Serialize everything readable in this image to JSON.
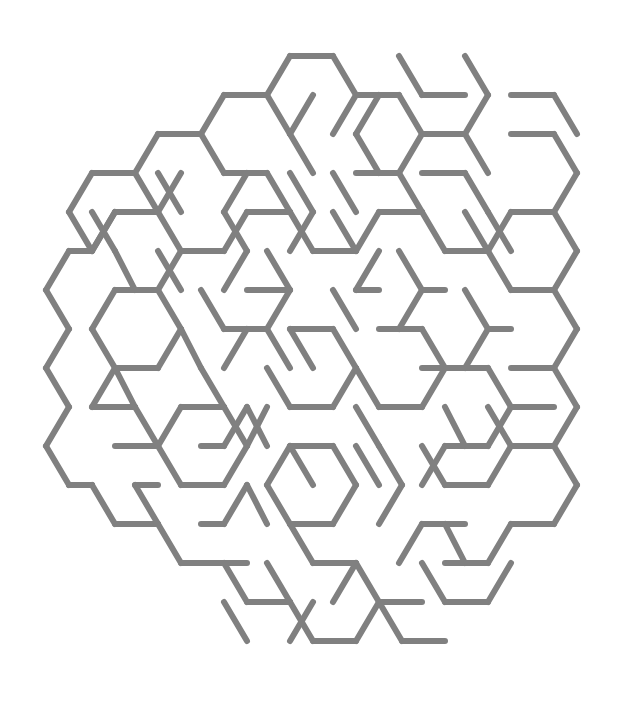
{
  "document": {
    "title": "Hexagonal Maze",
    "kind": "puzzle-maze",
    "description": "A hexagonal-cell maze rendered as gray line segments on a white background."
  },
  "canvas": {
    "width": 618,
    "height": 713,
    "background_color": "#ffffff"
  },
  "style": {
    "wall_color": "#808080",
    "wall_width": 6,
    "line_cap": "round",
    "line_join": "round"
  },
  "geometry": {
    "hex_orientation": "flat-top",
    "side_length": 23.0,
    "column_pitch_x": 34.5,
    "row_pitch_y": 39.8,
    "origin_x": 295,
    "origin_y": 76,
    "columns": 15,
    "rows": 17
  },
  "maze": {
    "cell_count": 169,
    "bounding_box": {
      "left": 40,
      "top": 45,
      "right": 580,
      "bottom": 668
    },
    "wall_segment_count": 232,
    "walls": [
      [
        290,
        56,
        333,
        56
      ],
      [
        333,
        56,
        356,
        95
      ],
      [
        290,
        56,
        267,
        95
      ],
      [
        267,
        95,
        290,
        134
      ],
      [
        356,
        95,
        399,
        95
      ],
      [
        399,
        95,
        422,
        134
      ],
      [
        356,
        95,
        333,
        134
      ],
      [
        422,
        134,
        465,
        134
      ],
      [
        465,
        134,
        488,
        95
      ],
      [
        488,
        95,
        465,
        56
      ],
      [
        465,
        134,
        488,
        173
      ],
      [
        422,
        134,
        399,
        173
      ],
      [
        224,
        95,
        267,
        95
      ],
      [
        224,
        95,
        201,
        134
      ],
      [
        201,
        134,
        224,
        173
      ],
      [
        158,
        134,
        201,
        134
      ],
      [
        158,
        134,
        135,
        173
      ],
      [
        135,
        173,
        158,
        212
      ],
      [
        92,
        173,
        135,
        173
      ],
      [
        92,
        173,
        69,
        212
      ],
      [
        69,
        212,
        92,
        251
      ],
      [
        69,
        251,
        46,
        290
      ],
      [
        46,
        290,
        69,
        329
      ],
      [
        69,
        329,
        46,
        368
      ],
      [
        46,
        368,
        69,
        407
      ],
      [
        69,
        407,
        46,
        446
      ],
      [
        46,
        446,
        69,
        485
      ],
      [
        69,
        485,
        92,
        485
      ],
      [
        92,
        485,
        115,
        524
      ],
      [
        115,
        524,
        158,
        524
      ],
      [
        158,
        524,
        181,
        563
      ],
      [
        181,
        563,
        224,
        563
      ],
      [
        224,
        563,
        247,
        602
      ],
      [
        247,
        602,
        290,
        602
      ],
      [
        290,
        602,
        313,
        641
      ],
      [
        313,
        641,
        356,
        641
      ],
      [
        356,
        641,
        379,
        602
      ],
      [
        379,
        602,
        422,
        602
      ],
      [
        92,
        251,
        69,
        251
      ],
      [
        92,
        251,
        115,
        212
      ],
      [
        115,
        212,
        158,
        212
      ],
      [
        158,
        212,
        181,
        251
      ],
      [
        181,
        251,
        224,
        251
      ],
      [
        224,
        251,
        247,
        212
      ],
      [
        247,
        212,
        290,
        212
      ],
      [
        290,
        212,
        313,
        251
      ],
      [
        313,
        251,
        356,
        251
      ],
      [
        356,
        251,
        379,
        212
      ],
      [
        379,
        212,
        422,
        212
      ],
      [
        422,
        212,
        445,
        251
      ],
      [
        445,
        251,
        488,
        251
      ],
      [
        488,
        251,
        511,
        212
      ],
      [
        511,
        212,
        554,
        212
      ],
      [
        554,
        212,
        577,
        251
      ],
      [
        577,
        251,
        554,
        290
      ],
      [
        554,
        290,
        577,
        329
      ],
      [
        577,
        329,
        554,
        368
      ],
      [
        554,
        368,
        577,
        407
      ],
      [
        577,
        407,
        554,
        446
      ],
      [
        554,
        446,
        577,
        485
      ],
      [
        577,
        485,
        554,
        524
      ],
      [
        554,
        524,
        511,
        524
      ],
      [
        511,
        524,
        488,
        563
      ],
      [
        488,
        563,
        445,
        563
      ],
      [
        115,
        290,
        158,
        290
      ],
      [
        158,
        290,
        181,
        329
      ],
      [
        181,
        329,
        158,
        368
      ],
      [
        158,
        368,
        115,
        368
      ],
      [
        115,
        368,
        92,
        329
      ],
      [
        92,
        329,
        115,
        290
      ],
      [
        201,
        290,
        224,
        329
      ],
      [
        224,
        329,
        267,
        329
      ],
      [
        267,
        329,
        290,
        290
      ],
      [
        290,
        290,
        267,
        251
      ],
      [
        247,
        290,
        290,
        290
      ],
      [
        267,
        368,
        290,
        407
      ],
      [
        290,
        407,
        333,
        407
      ],
      [
        333,
        407,
        356,
        368
      ],
      [
        356,
        368,
        333,
        329
      ],
      [
        333,
        329,
        290,
        329
      ],
      [
        181,
        407,
        224,
        407
      ],
      [
        224,
        407,
        247,
        446
      ],
      [
        247,
        446,
        224,
        485
      ],
      [
        224,
        485,
        181,
        485
      ],
      [
        181,
        485,
        158,
        446
      ],
      [
        158,
        446,
        181,
        407
      ],
      [
        115,
        446,
        158,
        446
      ],
      [
        135,
        485,
        158,
        524
      ],
      [
        201,
        524,
        224,
        524
      ],
      [
        224,
        524,
        247,
        485
      ],
      [
        290,
        446,
        333,
        446
      ],
      [
        333,
        446,
        356,
        485
      ],
      [
        356,
        485,
        333,
        524
      ],
      [
        333,
        524,
        290,
        524
      ],
      [
        290,
        524,
        267,
        485
      ],
      [
        267,
        485,
        290,
        446
      ],
      [
        379,
        329,
        422,
        329
      ],
      [
        422,
        329,
        445,
        368
      ],
      [
        445,
        368,
        422,
        407
      ],
      [
        422,
        407,
        379,
        407
      ],
      [
        379,
        407,
        356,
        368
      ],
      [
        399,
        251,
        422,
        290
      ],
      [
        422,
        290,
        399,
        329
      ],
      [
        465,
        290,
        488,
        329
      ],
      [
        488,
        329,
        465,
        368
      ],
      [
        465,
        368,
        422,
        368
      ],
      [
        445,
        446,
        488,
        446
      ],
      [
        488,
        446,
        511,
        407
      ],
      [
        511,
        407,
        488,
        368
      ],
      [
        488,
        368,
        445,
        368
      ],
      [
        511,
        290,
        554,
        290
      ],
      [
        511,
        290,
        488,
        251
      ],
      [
        445,
        485,
        488,
        485
      ],
      [
        488,
        485,
        511,
        446
      ],
      [
        333,
        173,
        356,
        212
      ],
      [
        356,
        173,
        399,
        173
      ],
      [
        267,
        173,
        290,
        212
      ],
      [
        224,
        173,
        267,
        173
      ],
      [
        181,
        173,
        158,
        212
      ],
      [
        356,
        134,
        379,
        173
      ],
      [
        422,
        173,
        465,
        173
      ],
      [
        465,
        173,
        488,
        212
      ],
      [
        92,
        407,
        135,
        407
      ],
      [
        135,
        407,
        158,
        446
      ],
      [
        115,
        368,
        92,
        407
      ],
      [
        247,
        173,
        224,
        212
      ],
      [
        290,
        134,
        313,
        173
      ],
      [
        379,
        446,
        402,
        485
      ],
      [
        402,
        485,
        379,
        524
      ],
      [
        356,
        563,
        379,
        602
      ],
      [
        313,
        563,
        356,
        563
      ],
      [
        313,
        563,
        290,
        524
      ],
      [
        267,
        563,
        290,
        602
      ],
      [
        247,
        563,
        224,
        563
      ],
      [
        399,
        563,
        422,
        524
      ],
      [
        422,
        524,
        465,
        524
      ],
      [
        445,
        602,
        488,
        602
      ],
      [
        488,
        602,
        511,
        563
      ],
      [
        201,
        446,
        224,
        446
      ],
      [
        92,
        485,
        69,
        485
      ],
      [
        158,
        251,
        181,
        290
      ],
      [
        224,
        212,
        247,
        251
      ],
      [
        313,
        95,
        290,
        134
      ],
      [
        379,
        95,
        356,
        134
      ],
      [
        511,
        134,
        554,
        134
      ],
      [
        554,
        134,
        577,
        173
      ],
      [
        577,
        173,
        554,
        212
      ],
      [
        511,
        95,
        554,
        95
      ],
      [
        554,
        95,
        577,
        134
      ],
      [
        488,
        407,
        511,
        446
      ],
      [
        422,
        446,
        445,
        485
      ],
      [
        333,
        602,
        356,
        563
      ],
      [
        290,
        641,
        313,
        602
      ],
      [
        135,
        290,
        115,
        251
      ],
      [
        201,
        368,
        224,
        407
      ],
      [
        267,
        446,
        247,
        407
      ],
      [
        313,
        368,
        290,
        329
      ],
      [
        356,
        290,
        379,
        290
      ],
      [
        247,
        329,
        224,
        368
      ],
      [
        465,
        212,
        488,
        251
      ],
      [
        399,
        173,
        422,
        212
      ],
      [
        92,
        212,
        115,
        251
      ],
      [
        158,
        173,
        181,
        212
      ],
      [
        313,
        485,
        290,
        446
      ],
      [
        379,
        485,
        356,
        446
      ],
      [
        511,
        368,
        554,
        368
      ],
      [
        465,
        446,
        445,
        407
      ],
      [
        224,
        602,
        247,
        641
      ],
      [
        402,
        641,
        445,
        641
      ],
      [
        402,
        641,
        379,
        602
      ],
      [
        135,
        407,
        115,
        368
      ],
      [
        181,
        329,
        201,
        368
      ],
      [
        290,
        368,
        267,
        329
      ],
      [
        247,
        251,
        224,
        290
      ],
      [
        356,
        407,
        379,
        446
      ],
      [
        422,
        485,
        445,
        446
      ],
      [
        511,
        251,
        488,
        212
      ],
      [
        554,
        446,
        511,
        446
      ],
      [
        290,
        173,
        313,
        212
      ],
      [
        333,
        212,
        356,
        251
      ],
      [
        181,
        251,
        158,
        290
      ],
      [
        115,
        212,
        92,
        251
      ],
      [
        465,
        95,
        422,
        95
      ],
      [
        399,
        56,
        422,
        95
      ],
      [
        333,
        290,
        356,
        329
      ],
      [
        267,
        407,
        247,
        446
      ],
      [
        511,
        329,
        488,
        329
      ],
      [
        554,
        407,
        511,
        407
      ],
      [
        224,
        446,
        247,
        407
      ],
      [
        158,
        485,
        135,
        485
      ],
      [
        379,
        251,
        356,
        290
      ],
      [
        445,
        290,
        422,
        290
      ],
      [
        290,
        251,
        313,
        212
      ],
      [
        247,
        485,
        267,
        524
      ],
      [
        465,
        563,
        445,
        524
      ],
      [
        422,
        563,
        445,
        602
      ]
    ]
  },
  "legend": {
    "wall_label": "maze wall",
    "opening_note": "Entrance at upper-right, exit at lower-right"
  }
}
